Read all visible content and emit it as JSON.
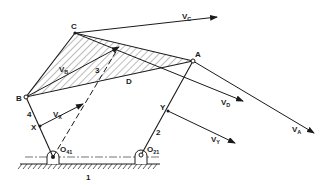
{
  "diagram": {
    "colors": {
      "ink": "#1a1a1a",
      "background": "#ffffff"
    },
    "points": {
      "C": {
        "label": "C",
        "x": 75,
        "y": 33
      },
      "B": {
        "label": "B",
        "x": 26,
        "y": 97
      },
      "A": {
        "label": "A",
        "x": 193,
        "y": 61
      },
      "D": {
        "label": "D",
        "x": 130,
        "y": 75
      },
      "X": {
        "label": "X",
        "x": 40,
        "y": 126
      },
      "Y": {
        "label": "Y",
        "x": 168,
        "y": 111
      },
      "O41": {
        "label": "O",
        "sub": "41",
        "x": 53,
        "y": 157
      },
      "O21": {
        "label": "O",
        "sub": "21",
        "x": 141,
        "y": 155
      }
    },
    "links": {
      "link1": "1",
      "link2": "2",
      "link3": "3",
      "link4": "4"
    },
    "vectors": {
      "VC": {
        "label": "V",
        "sub": "C"
      },
      "VB": {
        "label": "V",
        "sub": "B"
      },
      "VD": {
        "label": "V",
        "sub": "D"
      },
      "VA": {
        "label": "V",
        "sub": "A"
      },
      "VX": {
        "label": "V",
        "sub": "X"
      },
      "VY": {
        "label": "V",
        "sub": "Y"
      }
    }
  }
}
